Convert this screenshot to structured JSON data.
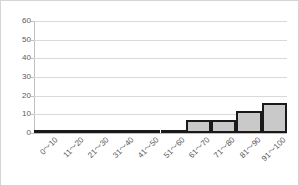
{
  "chart_data": {
    "type": "bar",
    "title": "",
    "subtitle": "",
    "xlabel": "",
    "ylabel": "",
    "categories": [
      "0～10",
      "11～20",
      "21～30",
      "31～40",
      "41～50",
      "51～60",
      "61～70",
      "71～80",
      "81～90",
      "91～100"
    ],
    "values": [
      0,
      1,
      0,
      1,
      1,
      0,
      7,
      7,
      12,
      16
    ],
    "ylim": [
      0,
      60
    ],
    "ytick_labels": [
      "60",
      "50",
      "40",
      "30",
      "20",
      "10",
      "0"
    ],
    "ytick_values": [
      60,
      50,
      40,
      30,
      20,
      10,
      0
    ],
    "ytick_interval": 10,
    "grid": true,
    "grid_axis": "y",
    "legend": false,
    "legend_position": "none",
    "bar_fill_color": "#c9c9c9",
    "bar_border_color": "#1a1a1a",
    "gridline_color": "#d9d9d9",
    "axis_color": "#bfbfbf",
    "tick_label_color": "#595959",
    "frame_border_color": "#d4d4d4",
    "background_color": "#ffffff"
  }
}
